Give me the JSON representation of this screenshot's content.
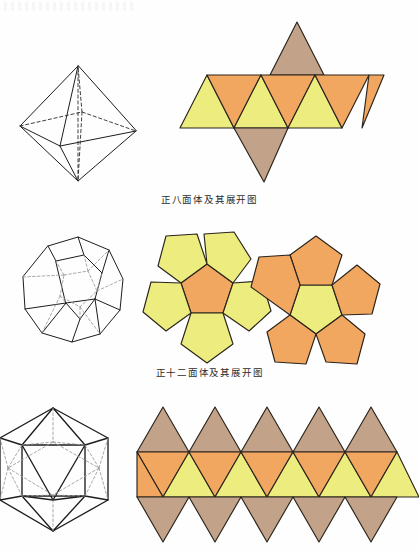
{
  "page": {
    "background_color": "#fefefe",
    "width": 419,
    "height": 550,
    "language": "zh-CN",
    "top_artifact_label": ""
  },
  "palette": {
    "yellow": "#eced7e",
    "orange": "#f2a761",
    "brown": "#c2a288",
    "outline": "#2a241c",
    "wire_stroke": "#1d1d1d",
    "hidden_stroke": "#9a9a9a",
    "caption_color": "#2b2b2b"
  },
  "figures": [
    {
      "id": "octahedron",
      "caption": "正八面体及其展开图",
      "solid_name": "正八面体",
      "solid_label": "octahedron-wireframe",
      "net_label": "octahedron-net",
      "face_count": 8,
      "face_shape": "triangle",
      "net_face_colors": [
        "yellow",
        "orange",
        "yellow",
        "orange",
        "yellow",
        "orange",
        "brown",
        "brown"
      ]
    },
    {
      "id": "dodecahedron",
      "caption": "正十二面体及其展开图",
      "solid_name": "正十二面体",
      "solid_label": "dodecahedron-wireframe",
      "net_label": "dodecahedron-net",
      "face_count": 12,
      "face_shape": "pentagon",
      "net_face_colors": [
        "orange",
        "yellow",
        "yellow",
        "yellow",
        "yellow",
        "yellow",
        "yellow",
        "orange",
        "orange",
        "orange",
        "orange",
        "orange"
      ]
    },
    {
      "id": "icosahedron",
      "caption": "",
      "solid_name": "正二十面体",
      "solid_label": "icosahedron-wireframe",
      "net_label": "icosahedron-net",
      "face_count": 20,
      "face_shape": "triangle",
      "net_rows": [
        {
          "row": "top",
          "color": "brown",
          "count": 5,
          "orientation": "up"
        },
        {
          "row": "middle-down",
          "color": "orange",
          "count": 5,
          "orientation": "down"
        },
        {
          "row": "middle-up",
          "color": "yellow",
          "count": 5,
          "orientation": "up"
        },
        {
          "row": "bottom",
          "color": "brown",
          "count": 5,
          "orientation": "down"
        }
      ]
    }
  ]
}
